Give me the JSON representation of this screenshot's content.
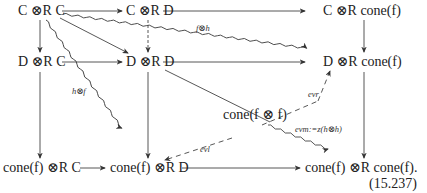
{
  "nodes": {
    "cc": "C ⊗R C",
    "cd": "C ⊗R D",
    "ccone": "C ⊗R cone(f)",
    "dc": "D ⊗R C",
    "dd": "D ⊗R D",
    "dcone": "D ⊗R cone(f)",
    "coneff": "cone(f ⊗ f)",
    "conec": "cone(f) ⊗R C",
    "coned": "cone(f) ⊗R D",
    "conecone": "cone(f) ⊗R cone(f)."
  },
  "labels": {
    "f_tensor_h": "f⊗h",
    "h_tensor_f": "h⊗f",
    "ev_r": "evr",
    "ev_l": "evl",
    "ev_m": "evm:=z(h⊗h)"
  },
  "equation_number": "(15.237)"
}
